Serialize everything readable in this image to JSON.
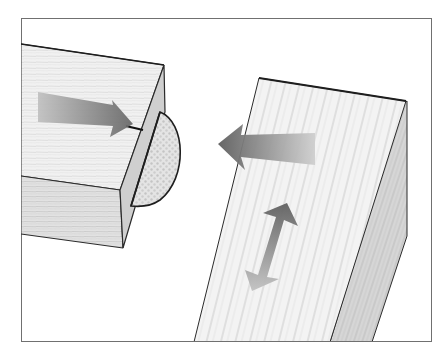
{
  "figure": {
    "description": "Biscuit joint illustration: a board end with a biscuit (plate) inserted into a slot, and a second board angled to receive it; arrows indicate joining motion and side-to-side adjustment",
    "frame_color": "#707070",
    "background": "#ffffff",
    "wood_light": "#f2f2f2",
    "wood_mid": "#dcdcdc",
    "wood_dark": "#bdbdbd",
    "arrow_dark": "#6a6a6a",
    "arrow_light": "#c8c8c8",
    "outline": "#1e1e1e"
  },
  "elements": {
    "left_block": "Board with slot and biscuit",
    "biscuit": "Half-inserted oval biscuit",
    "right_board": "Angled mating board",
    "arrow_push": "Arrow pointing right toward slot",
    "arrow_join": "Arrow pointing left toward biscuit",
    "arrow_adjust": "Double-headed arrow for lateral adjustment"
  }
}
